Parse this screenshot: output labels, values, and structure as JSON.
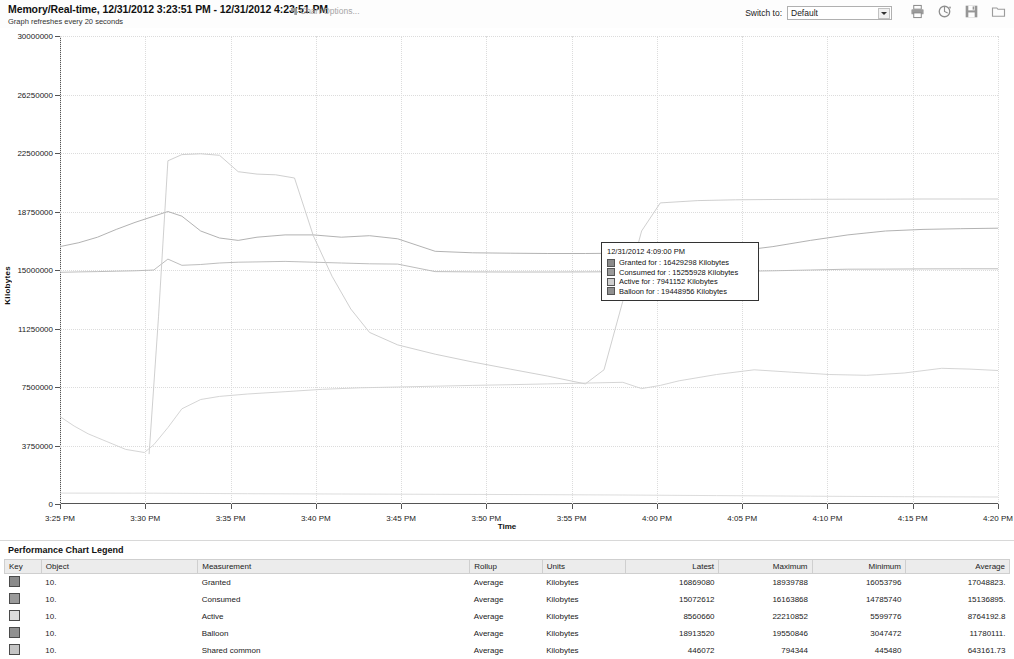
{
  "header": {
    "chart_title": "Memory/Real-time, 12/31/2012 3:23:51 PM - 12/31/2012 4:23:51 PM",
    "refresh_note": "Graph refreshes every 20 seconds",
    "chart_options_label": "Chart Options...",
    "switch_to_label": "Switch to:",
    "switch_to_value": "Default",
    "switch_to_options": [
      "Default"
    ],
    "icons": [
      "print-icon",
      "refresh-icon",
      "save-icon",
      "folder-icon"
    ]
  },
  "tooltip": {
    "time": "12/31/2012 4:09:00 PM",
    "rows": [
      {
        "label": "Granted for : 16429298 Kilobytes",
        "swatch": "#8a8a8a"
      },
      {
        "label": "Consumed for : 15255928 Kilobytes",
        "swatch": "#9a9a9a"
      },
      {
        "label": "Active for : 7941152 Kilobytes",
        "swatch": "#cfcfcf"
      },
      {
        "label": "Balloon for : 19448956 Kilobytes",
        "swatch": "#909090"
      }
    ]
  },
  "legend": {
    "title": "Performance Chart Legend",
    "columns": [
      "Key",
      "Object",
      "Measurement",
      "Rollup",
      "Units",
      "Latest",
      "Maximum",
      "Minimum",
      "Average"
    ],
    "rows": [
      {
        "key": "#8a8a8a",
        "object": "10.",
        "measurement": "Granted",
        "rollup": "Average",
        "units": "Kilobytes",
        "latest": "16869080",
        "maximum": "18939788",
        "minimum": "16053796",
        "average": "17048823."
      },
      {
        "key": "#9a9a9a",
        "object": "10.",
        "measurement": "Consumed",
        "rollup": "Average",
        "units": "Kilobytes",
        "latest": "15072612",
        "maximum": "16163868",
        "minimum": "14785740",
        "average": "15136895."
      },
      {
        "key": "#dcdcdc",
        "object": "10.",
        "measurement": "Active",
        "rollup": "Average",
        "units": "Kilobytes",
        "latest": "8560660",
        "maximum": "22210852",
        "minimum": "5599776",
        "average": "8764192.8"
      },
      {
        "key": "#909090",
        "object": "10.",
        "measurement": "Balloon",
        "rollup": "Average",
        "units": "Kilobytes",
        "latest": "18913520",
        "maximum": "19550846",
        "minimum": "3047472",
        "average": "11780111."
      },
      {
        "key": "#c4c4c4",
        "object": "10.",
        "measurement": "Shared common",
        "rollup": "Average",
        "units": "Kilobytes",
        "latest": "446072",
        "maximum": "794344",
        "minimum": "445480",
        "average": "643161.73"
      }
    ]
  },
  "chart_data": {
    "type": "line",
    "title": "Memory/Real-time, 12/31/2012 3:23:51 PM - 12/31/2012 4:23:51 PM",
    "xlabel": "Time",
    "ylabel": "Kilobytes",
    "ylim": [
      0,
      30000000
    ],
    "yticks": [
      0,
      3750000,
      7500000,
      11250000,
      15000000,
      18750000,
      22500000,
      26250000,
      30000000
    ],
    "ytick_labels": [
      "0",
      "3750000",
      "7500000",
      "11250000",
      "15000000",
      "18750000",
      "22500000",
      "26250000",
      "30000000"
    ],
    "xticks": [
      "3:25 PM",
      "3:30 PM",
      "3:35 PM",
      "3:40 PM",
      "3:45 PM",
      "3:50 PM",
      "3:55 PM",
      "4:00 PM",
      "4:05 PM",
      "4:10 PM",
      "4:15 PM",
      "4:20 PM"
    ],
    "grid": true,
    "legend_position": "below-table",
    "series": [
      {
        "name": "Granted",
        "color": "#a9a9a9",
        "x": [
          0,
          0.02,
          0.04,
          0.06,
          0.08,
          0.1,
          0.115,
          0.13,
          0.15,
          0.17,
          0.19,
          0.21,
          0.24,
          0.27,
          0.3,
          0.33,
          0.36,
          0.4,
          0.44,
          0.48,
          0.52,
          0.56,
          0.6,
          0.64,
          0.68,
          0.72,
          0.76,
          0.8,
          0.84,
          0.88,
          0.92,
          0.96,
          1.0
        ],
        "values": [
          16500000,
          16750000,
          17100000,
          17600000,
          18050000,
          18450000,
          18750000,
          18450000,
          17500000,
          17050000,
          16900000,
          17100000,
          17250000,
          17250000,
          17100000,
          17200000,
          17000000,
          16200000,
          16100000,
          16080000,
          16060000,
          16060000,
          16080000,
          16100000,
          16150000,
          16200000,
          16500000,
          16900000,
          17250000,
          17500000,
          17600000,
          17650000,
          17680000
        ]
      },
      {
        "name": "Consumed",
        "color": "#b5b5b5",
        "x": [
          0,
          0.02,
          0.04,
          0.06,
          0.08,
          0.1,
          0.115,
          0.13,
          0.15,
          0.17,
          0.19,
          0.21,
          0.24,
          0.27,
          0.3,
          0.33,
          0.36,
          0.4,
          0.44,
          0.48,
          0.52,
          0.56,
          0.6,
          0.64,
          0.68,
          0.72,
          0.76,
          0.8,
          0.84,
          0.88,
          0.92,
          0.96,
          1.0
        ],
        "values": [
          14850000,
          14880000,
          14900000,
          14920000,
          14950000,
          15000000,
          15700000,
          15300000,
          15350000,
          15450000,
          15500000,
          15520000,
          15550000,
          15500000,
          15450000,
          15400000,
          15380000,
          14900000,
          14880000,
          14870000,
          14870000,
          14880000,
          14890000,
          14900000,
          14900000,
          14910000,
          14950000,
          15000000,
          15050000,
          15060000,
          15070000,
          15080000,
          15080000
        ]
      },
      {
        "name": "Balloon",
        "color": "#c9c9c9",
        "x": [
          0,
          0.02,
          0.04,
          0.06,
          0.08,
          0.095,
          0.105,
          0.115,
          0.13,
          0.15,
          0.17,
          0.19,
          0.21,
          0.23,
          0.25,
          0.27,
          0.29,
          0.31,
          0.33,
          0.36,
          0.4,
          0.44,
          0.48,
          0.52,
          0.56,
          0.58,
          0.6,
          0.62,
          0.64,
          0.68,
          0.72,
          0.76,
          0.8,
          0.84,
          0.88,
          0.92,
          0.96,
          1.0
        ],
        "values": [
          null,
          null,
          null,
          null,
          null,
          3200000,
          12000000,
          22000000,
          22400000,
          22450000,
          22350000,
          21300000,
          21150000,
          21100000,
          20900000,
          17200000,
          14600000,
          12500000,
          11000000,
          10200000,
          9600000,
          9100000,
          8650000,
          8200000,
          7700000,
          8600000,
          13000000,
          17500000,
          19300000,
          19450000,
          19500000,
          19520000,
          19530000,
          19540000,
          19540000,
          19550000,
          19550000,
          19550000
        ]
      },
      {
        "name": "Active",
        "color": "#d0d0d0",
        "x": [
          0,
          0.015,
          0.03,
          0.05,
          0.07,
          0.09,
          0.1,
          0.115,
          0.13,
          0.15,
          0.17,
          0.2,
          0.24,
          0.28,
          0.32,
          0.36,
          0.4,
          0.44,
          0.48,
          0.52,
          0.56,
          0.6,
          0.62,
          0.64,
          0.66,
          0.7,
          0.74,
          0.78,
          0.82,
          0.86,
          0.9,
          0.94,
          0.97,
          1.0
        ],
        "values": [
          5600000,
          5000000,
          4500000,
          4000000,
          3500000,
          3300000,
          3800000,
          4900000,
          6100000,
          6700000,
          6900000,
          7050000,
          7200000,
          7350000,
          7450000,
          7500000,
          7550000,
          7600000,
          7650000,
          7700000,
          7750000,
          7800000,
          7400000,
          7600000,
          7900000,
          8300000,
          8600000,
          8450000,
          8300000,
          8250000,
          8400000,
          8700000,
          8650000,
          8560000
        ]
      },
      {
        "name": "Shared common",
        "color": "#d8d8d8",
        "x": [
          0,
          0.1,
          0.2,
          0.3,
          0.4,
          0.5,
          0.6,
          0.7,
          0.8,
          0.9,
          1.0
        ],
        "values": [
          700000,
          690000,
          660000,
          640000,
          620000,
          600000,
          580000,
          540000,
          500000,
          470000,
          446072
        ]
      }
    ]
  }
}
